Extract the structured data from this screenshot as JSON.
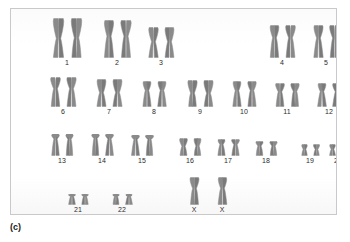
{
  "figure": {
    "caption": "(c)",
    "panel_background": "#fefefe",
    "border_color": "#c9c9c9",
    "chromosome_color": "#8a8a8a",
    "chromosome_color_dark": "#7a7a7a",
    "label_color": "#2b2b2b"
  },
  "karyotype": {
    "type": "human karyotype",
    "rows": [
      {
        "id": "row-1",
        "groups": [
          {
            "label": "1",
            "left": 32,
            "width": 48,
            "arm_style": "metacentric-large",
            "h": 40,
            "w": 15
          },
          {
            "label": "2",
            "left": 84,
            "width": 44,
            "arm_style": "submetacentric-large",
            "h": 38,
            "w": 14
          },
          {
            "label": "3",
            "left": 128,
            "width": 44,
            "arm_style": "metacentric-mid",
            "h": 31,
            "w": 13
          },
          {
            "label": "4",
            "left": 250,
            "width": 42,
            "arm_style": "submetacentric-mid",
            "h": 33,
            "w": 13
          },
          {
            "label": "5",
            "left": 294,
            "width": 42,
            "arm_style": "submetacentric-mid",
            "h": 33,
            "w": 13
          }
        ]
      },
      {
        "id": "row-2",
        "groups": [
          {
            "label": "6",
            "left": 30,
            "width": 44,
            "arm_style": "submetacentric-mid",
            "h": 30,
            "w": 13
          },
          {
            "label": "7",
            "left": 76,
            "width": 44,
            "arm_style": "metacentric-mid",
            "h": 28,
            "w": 13
          },
          {
            "label": "8",
            "left": 122,
            "width": 42,
            "arm_style": "submetacentric-small",
            "h": 26,
            "w": 12
          },
          {
            "label": "9",
            "left": 168,
            "width": 42,
            "arm_style": "metacentric-mid",
            "h": 27,
            "w": 13
          },
          {
            "label": "10",
            "left": 212,
            "width": 42,
            "arm_style": "submetacentric-small",
            "h": 26,
            "w": 12
          },
          {
            "label": "11",
            "left": 256,
            "width": 40,
            "arm_style": "submetacentric-small",
            "h": 24,
            "w": 12
          },
          {
            "label": "12",
            "left": 298,
            "width": 40,
            "arm_style": "submetacentric-small",
            "h": 24,
            "w": 12
          }
        ]
      },
      {
        "id": "row-3",
        "groups": [
          {
            "label": "13",
            "left": 32,
            "width": 38,
            "arm_style": "acrocentric",
            "h": 22,
            "w": 11
          },
          {
            "label": "14",
            "left": 72,
            "width": 38,
            "arm_style": "acrocentric",
            "h": 22,
            "w": 11
          },
          {
            "label": "15",
            "left": 112,
            "width": 38,
            "arm_style": "acrocentric",
            "h": 21,
            "w": 11
          },
          {
            "label": "16",
            "left": 160,
            "width": 38,
            "arm_style": "metacentric-small",
            "h": 18,
            "w": 11
          },
          {
            "label": "17",
            "left": 198,
            "width": 38,
            "arm_style": "submetacentric-tiny",
            "h": 17,
            "w": 11
          },
          {
            "label": "18",
            "left": 236,
            "width": 38,
            "arm_style": "submetacentric-tiny",
            "h": 15,
            "w": 11
          },
          {
            "label": "19",
            "left": 284,
            "width": 30,
            "arm_style": "metacentric-tiny",
            "h": 12,
            "w": 9
          },
          {
            "label": "20",
            "left": 312,
            "width": 30,
            "arm_style": "metacentric-tiny",
            "h": 12,
            "w": 9
          }
        ]
      },
      {
        "id": "row-4",
        "groups": [
          {
            "label": "21",
            "left": 48,
            "width": 38,
            "arm_style": "acrocentric-tiny",
            "h": 11,
            "w": 10
          },
          {
            "label": "22",
            "left": 92,
            "width": 38,
            "arm_style": "acrocentric-tiny",
            "h": 11,
            "w": 10
          },
          {
            "label": "X",
            "left": 170,
            "width": 26,
            "arm_style": "submetacentric-x",
            "h": 28,
            "w": 13
          },
          {
            "label": "X",
            "left": 198,
            "width": 26,
            "arm_style": "submetacentric-x",
            "h": 28,
            "w": 13
          }
        ]
      }
    ]
  }
}
